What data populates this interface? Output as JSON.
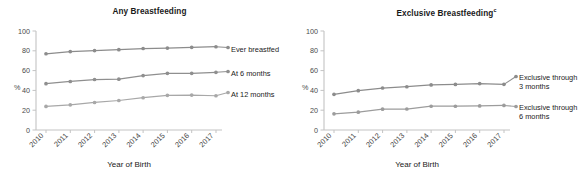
{
  "figure": {
    "background": "#ffffff",
    "axis_color": "#c8c8c8",
    "text_color": "#231f20"
  },
  "panels": [
    {
      "id": "any-breastfeeding",
      "title": "Any Breastfeeding",
      "title_superscript": "",
      "xlabel": "Year of Birth",
      "ylabel": "%"
    },
    {
      "id": "exclusive-breastfeeding",
      "title": "Exclusive Breastfeeding",
      "title_superscript": "c",
      "xlabel": "Year of Birth",
      "ylabel": "%"
    }
  ],
  "chart_data": [
    {
      "type": "line",
      "title": "Any Breastfeeding",
      "xlabel": "Year of Birth",
      "ylabel": "%",
      "x": [
        2010,
        2011,
        2012,
        2013,
        2014,
        2015,
        2016,
        2017
      ],
      "xtick_labels": [
        "2010",
        "2011",
        "2012",
        "2013",
        "2014",
        "2015",
        "2016",
        "2017"
      ],
      "ytick_labels": [
        "0",
        "20",
        "40",
        "60",
        "80",
        "100"
      ],
      "yticks": [
        0,
        20,
        40,
        60,
        80,
        100
      ],
      "ylim": [
        0,
        100
      ],
      "grid": false,
      "legend_position": "right-inline",
      "series": [
        {
          "name": "Ever breastfed",
          "color": "#8c8c8c",
          "values": [
            77.0,
            79.2,
            80.2,
            81.1,
            82.3,
            82.8,
            83.5,
            84.1
          ]
        },
        {
          "name": "At 6 months",
          "color": "#8f8f8f",
          "values": [
            46.8,
            49.0,
            51.0,
            51.3,
            55.0,
            57.2,
            57.2,
            58.3
          ]
        },
        {
          "name": "At 12 months",
          "color": "#a8a8a8",
          "values": [
            23.8,
            25.4,
            27.8,
            29.8,
            32.6,
            35.0,
            35.3,
            34.6
          ]
        }
      ]
    },
    {
      "type": "line",
      "title": "Exclusive Breastfeeding",
      "title_superscript": "c",
      "xlabel": "Year of Birth",
      "ylabel": "%",
      "x": [
        2010,
        2011,
        2012,
        2013,
        2014,
        2015,
        2016,
        2017
      ],
      "xtick_labels": [
        "2010",
        "2011",
        "2012",
        "2013",
        "2014",
        "2015",
        "2016",
        "2017"
      ],
      "ytick_labels": [
        "0",
        "20",
        "40",
        "60",
        "80",
        "100"
      ],
      "yticks": [
        0,
        20,
        40,
        60,
        80,
        100
      ],
      "ylim": [
        0,
        100
      ],
      "grid": false,
      "legend_position": "right-inline",
      "series": [
        {
          "name": "Exclusive through\n3 months",
          "color": "#8c8c8c",
          "values": [
            36.0,
            39.7,
            42.4,
            43.7,
            45.5,
            46.0,
            46.9,
            46.1
          ]
        },
        {
          "name": "Exclusive through\n6 months",
          "color": "#9c9c9c",
          "values": [
            16.3,
            18.0,
            21.0,
            21.2,
            24.0,
            24.0,
            24.3,
            24.8
          ]
        }
      ]
    }
  ]
}
